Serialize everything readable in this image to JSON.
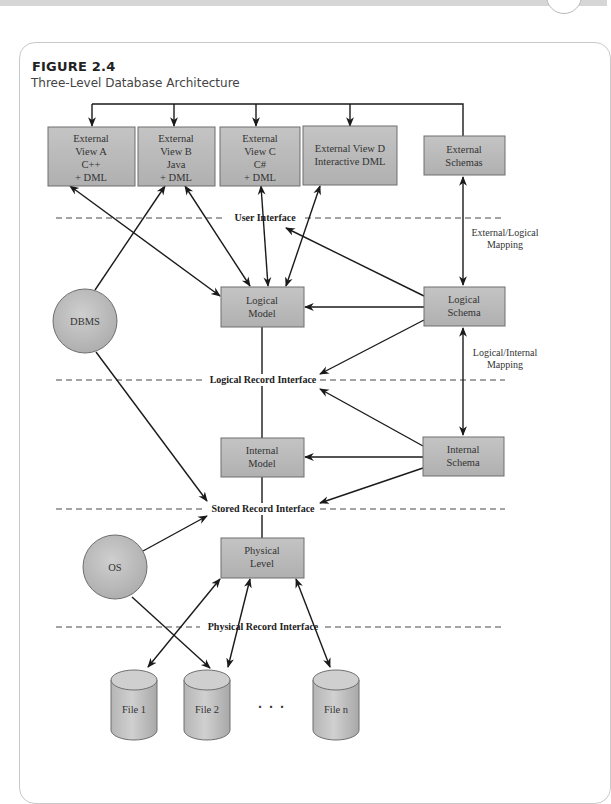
{
  "figure": {
    "label": "FIGURE 2.4",
    "caption": "Three-Level Database Architecture"
  },
  "diagram": {
    "external_views": [
      {
        "lines": [
          "External",
          "View A",
          "C++",
          "+ DML"
        ]
      },
      {
        "lines": [
          "External",
          "View B",
          "Java",
          "+ DML"
        ]
      },
      {
        "lines": [
          "External",
          "View C",
          "C#",
          "+ DML"
        ]
      },
      {
        "lines": [
          "External View D",
          "Interactive DML"
        ]
      }
    ],
    "external_schemas": {
      "lines": [
        "External",
        "Schemas"
      ]
    },
    "logical_model": {
      "lines": [
        "Logical",
        "Model"
      ]
    },
    "logical_schema": {
      "lines": [
        "Logical",
        "Schema"
      ]
    },
    "internal_model": {
      "lines": [
        "Internal",
        "Model"
      ]
    },
    "internal_schema": {
      "lines": [
        "Internal",
        "Schema"
      ]
    },
    "physical_level": {
      "lines": [
        "Physical",
        "Level"
      ]
    },
    "dbms": "DBMS",
    "os": "OS",
    "interfaces": {
      "user": "User Interface",
      "logical_record": "Logical Record Interface",
      "stored_record": "Stored Record Interface",
      "physical_record": "Physical Record Interface"
    },
    "mappings": {
      "external_logical": [
        "External/Logical",
        "Mapping"
      ],
      "logical_internal": [
        "Logical/Internal",
        "Mapping"
      ]
    },
    "files": [
      "File 1",
      "File 2",
      "File n"
    ],
    "ellipsis": ". . ."
  }
}
